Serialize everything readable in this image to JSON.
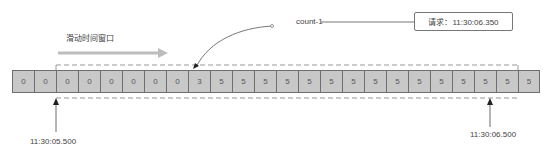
{
  "title": "滑动时间窗口",
  "request_box": {
    "label": "请求：11:30:06.350"
  },
  "annotation": {
    "label": "count-1"
  },
  "cells": [
    {
      "value": "0"
    },
    {
      "value": "0"
    },
    {
      "value": "0"
    },
    {
      "value": "0"
    },
    {
      "value": "0"
    },
    {
      "value": "0"
    },
    {
      "value": "0"
    },
    {
      "value": "0"
    },
    {
      "value": "3"
    },
    {
      "value": "5"
    },
    {
      "value": "5"
    },
    {
      "value": "5"
    },
    {
      "value": "5"
    },
    {
      "value": "5"
    },
    {
      "value": "5"
    },
    {
      "value": "5"
    },
    {
      "value": "5"
    },
    {
      "value": "5"
    },
    {
      "value": "5"
    },
    {
      "value": "5"
    },
    {
      "value": "5"
    },
    {
      "value": "5"
    },
    {
      "value": "5"
    },
    {
      "value": "5"
    }
  ],
  "window": {
    "start_cell_index": 2,
    "end_cell_index": 22
  },
  "markers": {
    "left": {
      "label": "11:30:05.500"
    },
    "right": {
      "label": "11:30:06.500"
    }
  },
  "colors": {
    "cell_fill": "#c8c8c8",
    "cell_border": "#6e6e6e",
    "slide_arrow": "#bdbdbd",
    "dashed_window": "#999999"
  }
}
